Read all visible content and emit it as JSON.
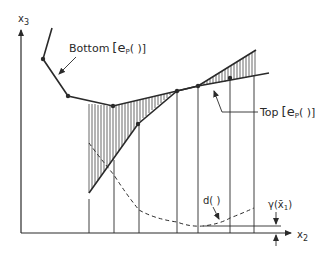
{
  "figure": {
    "type": "diagram",
    "axes": {
      "y_label": "x",
      "y_label_sub": "3",
      "x_label": "x",
      "x_label_sub": "2"
    },
    "labels": {
      "bottom": "Bottom",
      "bottom_bracket": "[e",
      "bottom_sub": "P",
      "bottom_tail": "( )]",
      "top": "Top",
      "top_bracket": "[e",
      "top_sub": "P",
      "top_tail": "( )]",
      "d": "d( )",
      "gamma": "γ(x̄",
      "gamma_sub": "1",
      "gamma_tail": ")"
    },
    "curves": {
      "bottom_polyline": [
        [
          52,
          28
        ],
        [
          43,
          59
        ],
        [
          68,
          96
        ],
        [
          113,
          106
        ],
        [
          177,
          91
        ],
        [
          198,
          86
        ],
        [
          269,
          73
        ]
      ],
      "top_polyline": [
        [
          89,
          193
        ],
        [
          138,
          124
        ],
        [
          177,
          91
        ],
        [
          198,
          86
        ],
        [
          256,
          50
        ]
      ],
      "d_dashed": [
        [
          89,
          143
        ],
        [
          114,
          175
        ],
        [
          139,
          210
        ],
        [
          177,
          222
        ],
        [
          198,
          226
        ],
        [
          230,
          218
        ],
        [
          254,
          208
        ]
      ]
    },
    "colors": {
      "ink": "#2a2a2a",
      "background": "#ffffff"
    }
  }
}
